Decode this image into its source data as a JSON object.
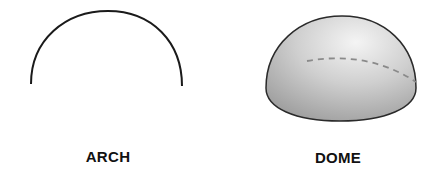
{
  "figures": [
    {
      "id": "arch",
      "label": "ARCH",
      "stroke": "#1a1a1a"
    },
    {
      "id": "dome",
      "label": "DOME",
      "stroke": "#2a2a2a",
      "fill_light": "#f2f2f2",
      "fill_dark": "#a8a8a8",
      "dash_color": "#8a8a8a"
    }
  ]
}
